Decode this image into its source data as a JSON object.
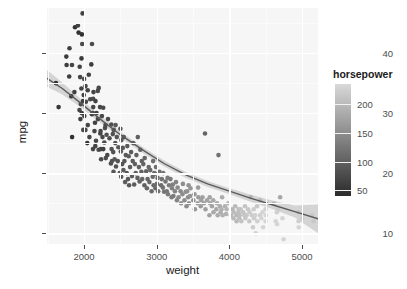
{
  "chart_data": {
    "type": "scatter",
    "title": "",
    "xlabel": "weight",
    "ylabel": "mpg",
    "xlim": [
      1490,
      5220
    ],
    "ylim": [
      8.2,
      47.5
    ],
    "xticks": [
      2000,
      3000,
      4000,
      5000
    ],
    "yticks": [
      10,
      20,
      30,
      40
    ],
    "xtick_labels": [
      "2000",
      "3000",
      "4000",
      "5000"
    ],
    "ytick_labels": [
      "10",
      "20",
      "30",
      "40"
    ],
    "grid": true,
    "legend": {
      "title": "horsepower",
      "position": "right",
      "type": "continuous-colorbar",
      "range": [
        40,
        235
      ],
      "ticks": [
        50,
        100,
        150,
        200
      ],
      "tick_labels": [
        "50",
        "100",
        "150",
        "200"
      ],
      "low_color": "#2b2b2b",
      "high_color": "#d9d9d9"
    },
    "smooth": {
      "type": "loess-trend-line",
      "line_color": "#5a5a5a",
      "ribbon_color": "#c8c8c8",
      "points_x": [
        1490,
        1700,
        1950,
        2200,
        2500,
        2800,
        3100,
        3400,
        3700,
        4000,
        4300,
        4600,
        4900,
        5220
      ],
      "points_y": [
        35.8,
        34.1,
        31.7,
        29.2,
        26.4,
        23.9,
        21.6,
        19.7,
        18.2,
        17.0,
        15.8,
        14.7,
        13.6,
        12.4
      ],
      "ribbon_upper": [
        37.2,
        35.1,
        32.4,
        29.8,
        26.9,
        24.4,
        22.1,
        20.2,
        18.7,
        17.5,
        16.4,
        15.4,
        14.6,
        14.8
      ],
      "ribbon_lower": [
        34.4,
        33.1,
        31.0,
        28.6,
        25.9,
        23.4,
        21.1,
        19.2,
        17.7,
        16.5,
        15.2,
        14.0,
        12.6,
        10.0
      ]
    },
    "point_color_scale": "grayscale-by-horsepower",
    "points": [
      [
        1613,
        35.0,
        46
      ],
      [
        1649,
        31.0,
        52
      ],
      [
        1755,
        39.4,
        58
      ],
      [
        1760,
        38.0,
        60
      ],
      [
        1795,
        36.1,
        60
      ],
      [
        1800,
        40.8,
        62
      ],
      [
        1825,
        32.8,
        52
      ],
      [
        1835,
        26.0,
        46
      ],
      [
        1834,
        38.0,
        67
      ],
      [
        1867,
        33.5,
        65
      ],
      [
        1875,
        44.3,
        48
      ],
      [
        1915,
        44.6,
        67
      ],
      [
        1925,
        43.4,
        48
      ],
      [
        1937,
        30.5,
        70
      ],
      [
        1940,
        37.7,
        67
      ],
      [
        1945,
        36.0,
        70
      ],
      [
        1950,
        29.0,
        63
      ],
      [
        1955,
        31.5,
        71
      ],
      [
        1963,
        34.1,
        68
      ],
      [
        1965,
        39.1,
        58
      ],
      [
        1968,
        30.0,
        63
      ],
      [
        1970,
        43.1,
        48
      ],
      [
        1975,
        41.5,
        76
      ],
      [
        1980,
        46.6,
        65
      ],
      [
        1985,
        32.0,
        65
      ],
      [
        1990,
        27.2,
        71
      ],
      [
        1995,
        33.0,
        67
      ],
      [
        2000,
        35.7,
        80
      ],
      [
        2003,
        29.5,
        68
      ],
      [
        2019,
        27.2,
        71
      ],
      [
        2020,
        34.5,
        70
      ],
      [
        2025,
        31.9,
        71
      ],
      [
        2045,
        25.0,
        52
      ],
      [
        2050,
        33.8,
        67
      ],
      [
        2051,
        28.0,
        71
      ],
      [
        2065,
        36.4,
        67
      ],
      [
        2074,
        26.0,
        70
      ],
      [
        2085,
        32.3,
        75
      ],
      [
        2100,
        38.1,
        60
      ],
      [
        2108,
        29.8,
        65
      ],
      [
        2110,
        41.5,
        76
      ],
      [
        2120,
        30.0,
        70
      ],
      [
        2123,
        24.0,
        73
      ],
      [
        2124,
        32.4,
        75
      ],
      [
        2126,
        31.0,
        70
      ],
      [
        2130,
        33.5,
        67
      ],
      [
        2144,
        27.0,
        70
      ],
      [
        2150,
        28.4,
        65
      ],
      [
        2155,
        24.5,
        68
      ],
      [
        2158,
        32.0,
        67
      ],
      [
        2164,
        25.4,
        75
      ],
      [
        2171,
        30.0,
        68
      ],
      [
        2189,
        33.7,
        75
      ],
      [
        2190,
        29.0,
        70
      ],
      [
        2200,
        23.9,
        77
      ],
      [
        2202,
        34.2,
        72
      ],
      [
        2219,
        31.0,
        70
      ],
      [
        2223,
        26.6,
        68
      ],
      [
        2228,
        27.0,
        71
      ],
      [
        2230,
        24.0,
        70
      ],
      [
        2234,
        22.3,
        76
      ],
      [
        2245,
        29.5,
        75
      ],
      [
        2254,
        26.0,
        72
      ],
      [
        2264,
        30.9,
        72
      ],
      [
        2265,
        24.0,
        65
      ],
      [
        2278,
        25.1,
        75
      ],
      [
        2288,
        27.5,
        78
      ],
      [
        2295,
        28.0,
        75
      ],
      [
        2300,
        22.5,
        80
      ],
      [
        2310,
        26.4,
        83
      ],
      [
        2320,
        23.0,
        75
      ],
      [
        2330,
        29.0,
        76
      ],
      [
        2350,
        25.8,
        80
      ],
      [
        2370,
        21.6,
        78
      ],
      [
        2375,
        28.1,
        79
      ],
      [
        2379,
        24.0,
        85
      ],
      [
        2385,
        22.0,
        85
      ],
      [
        2395,
        26.5,
        84
      ],
      [
        2401,
        23.5,
        83
      ],
      [
        2405,
        20.2,
        88
      ],
      [
        2408,
        27.2,
        84
      ],
      [
        2420,
        22.3,
        88
      ],
      [
        2430,
        25.0,
        85
      ],
      [
        2434,
        28.0,
        90
      ],
      [
        2440,
        21.1,
        85
      ],
      [
        2451,
        26.0,
        88
      ],
      [
        2464,
        22.0,
        86
      ],
      [
        2472,
        24.3,
        90
      ],
      [
        2490,
        20.0,
        88
      ],
      [
        2500,
        27.4,
        88
      ],
      [
        2506,
        23.6,
        90
      ],
      [
        2511,
        19.4,
        92
      ],
      [
        2514,
        25.5,
        92
      ],
      [
        2525,
        21.5,
        88
      ],
      [
        2533,
        24.2,
        90
      ],
      [
        2542,
        20.5,
        95
      ],
      [
        2545,
        26.0,
        90
      ],
      [
        2556,
        22.0,
        90
      ],
      [
        2565,
        18.5,
        95
      ],
      [
        2575,
        23.0,
        92
      ],
      [
        2587,
        20.0,
        90
      ],
      [
        2595,
        24.5,
        92
      ],
      [
        2605,
        19.0,
        90
      ],
      [
        2615,
        22.8,
        95
      ],
      [
        2620,
        18.0,
        92
      ],
      [
        2634,
        21.0,
        95
      ],
      [
        2648,
        23.5,
        95
      ],
      [
        2660,
        19.5,
        97
      ],
      [
        2670,
        22.0,
        95
      ],
      [
        2678,
        25.0,
        100
      ],
      [
        2690,
        18.1,
        95
      ],
      [
        2700,
        21.5,
        97
      ],
      [
        2711,
        20.0,
        97
      ],
      [
        2720,
        23.0,
        100
      ],
      [
        2735,
        19.2,
        100
      ],
      [
        2740,
        26.0,
        100
      ],
      [
        2755,
        21.0,
        98
      ],
      [
        2765,
        18.6,
        100
      ],
      [
        2774,
        23.9,
        105
      ],
      [
        2789,
        20.2,
        100
      ],
      [
        2795,
        22.0,
        103
      ],
      [
        2800,
        19.0,
        105
      ],
      [
        2815,
        21.5,
        105
      ],
      [
        2830,
        18.0,
        100
      ],
      [
        2835,
        22.5,
        105
      ],
      [
        2855,
        20.3,
        103
      ],
      [
        2865,
        17.5,
        110
      ],
      [
        2875,
        19.0,
        105
      ],
      [
        2890,
        21.0,
        110
      ],
      [
        2900,
        18.5,
        108
      ],
      [
        2910,
        20.5,
        110
      ],
      [
        2930,
        17.0,
        110
      ],
      [
        2945,
        19.4,
        112
      ],
      [
        2950,
        22.0,
        115
      ],
      [
        2957,
        18.0,
        110
      ],
      [
        2965,
        20.0,
        110
      ],
      [
        2979,
        19.9,
        115
      ],
      [
        2984,
        17.5,
        110
      ],
      [
        2990,
        21.0,
        115
      ],
      [
        3003,
        18.2,
        115
      ],
      [
        3012,
        19.2,
        115
      ],
      [
        3021,
        17.0,
        120
      ],
      [
        3039,
        20.2,
        120
      ],
      [
        3060,
        18.0,
        115
      ],
      [
        3070,
        19.0,
        120
      ],
      [
        3085,
        17.6,
        120
      ],
      [
        3090,
        20.0,
        125
      ],
      [
        3102,
        16.9,
        122
      ],
      [
        3121,
        18.6,
        125
      ],
      [
        3139,
        17.0,
        125
      ],
      [
        3150,
        19.2,
        130
      ],
      [
        3155,
        16.5,
        130
      ],
      [
        3169,
        18.0,
        130
      ],
      [
        3190,
        19.0,
        130
      ],
      [
        3205,
        16.0,
        130
      ],
      [
        3211,
        17.5,
        135
      ],
      [
        3221,
        18.1,
        135
      ],
      [
        3230,
        16.2,
        130
      ],
      [
        3250,
        17.0,
        140
      ],
      [
        3265,
        18.5,
        140
      ],
      [
        3278,
        15.5,
        140
      ],
      [
        3288,
        17.6,
        145
      ],
      [
        3302,
        16.0,
        145
      ],
      [
        3329,
        17.0,
        145
      ],
      [
        3336,
        15.0,
        150
      ],
      [
        3353,
        16.5,
        150
      ],
      [
        3360,
        18.2,
        150
      ],
      [
        3381,
        15.5,
        150
      ],
      [
        3399,
        16.9,
        150
      ],
      [
        3410,
        14.5,
        150
      ],
      [
        3420,
        17.0,
        155
      ],
      [
        3432,
        16.0,
        150
      ],
      [
        3439,
        18.0,
        155
      ],
      [
        3445,
        15.0,
        155
      ],
      [
        3459,
        16.2,
        155
      ],
      [
        3465,
        17.5,
        160
      ],
      [
        3504,
        15.5,
        150
      ],
      [
        3520,
        16.5,
        160
      ],
      [
        3525,
        14.0,
        160
      ],
      [
        3563,
        15.0,
        165
      ],
      [
        3570,
        17.6,
        165
      ],
      [
        3574,
        16.0,
        165
      ],
      [
        3605,
        14.5,
        165
      ],
      [
        3613,
        15.5,
        170
      ],
      [
        3630,
        16.0,
        170
      ],
      [
        3651,
        15.0,
        170
      ],
      [
        3664,
        26.6,
        105
      ],
      [
        3672,
        14.0,
        170
      ],
      [
        3693,
        15.5,
        175
      ],
      [
        3725,
        13.0,
        175
      ],
      [
        3730,
        16.0,
        175
      ],
      [
        3735,
        15.0,
        175
      ],
      [
        3761,
        14.5,
        175
      ],
      [
        3777,
        15.5,
        180
      ],
      [
        3781,
        13.5,
        180
      ],
      [
        3820,
        14.0,
        180
      ],
      [
        3830,
        15.0,
        180
      ],
      [
        3840,
        13.0,
        185
      ],
      [
        3850,
        23.0,
        120
      ],
      [
        3870,
        14.5,
        185
      ],
      [
        3880,
        13.5,
        185
      ],
      [
        3892,
        14.0,
        190
      ],
      [
        3900,
        16.0,
        185
      ],
      [
        3907,
        13.0,
        190
      ],
      [
        3940,
        14.5,
        190
      ],
      [
        3955,
        13.2,
        190
      ],
      [
        3962,
        14.0,
        195
      ],
      [
        3988,
        15.0,
        190
      ],
      [
        4020,
        13.0,
        195
      ],
      [
        4042,
        14.0,
        195
      ],
      [
        4055,
        12.5,
        200
      ],
      [
        4060,
        13.5,
        200
      ],
      [
        4080,
        14.5,
        200
      ],
      [
        4096,
        13.0,
        200
      ],
      [
        4100,
        12.0,
        200
      ],
      [
        4124,
        13.5,
        205
      ],
      [
        4129,
        14.0,
        205
      ],
      [
        4135,
        12.5,
        205
      ],
      [
        4141,
        13.0,
        205
      ],
      [
        4154,
        14.0,
        210
      ],
      [
        4165,
        12.0,
        210
      ],
      [
        4190,
        13.5,
        210
      ],
      [
        4209,
        13.0,
        210
      ],
      [
        4215,
        14.5,
        212
      ],
      [
        4220,
        12.5,
        215
      ],
      [
        4237,
        13.0,
        215
      ],
      [
        4257,
        14.0,
        215
      ],
      [
        4274,
        12.0,
        215
      ],
      [
        4278,
        13.5,
        218
      ],
      [
        4294,
        16.0,
        190
      ],
      [
        4312,
        13.0,
        220
      ],
      [
        4325,
        11.0,
        220
      ],
      [
        4335,
        14.0,
        220
      ],
      [
        4341,
        12.5,
        220
      ],
      [
        4354,
        13.0,
        225
      ],
      [
        4363,
        10.0,
        225
      ],
      [
        4380,
        14.5,
        215
      ],
      [
        4385,
        12.0,
        225
      ],
      [
        4422,
        13.0,
        225
      ],
      [
        4425,
        15.5,
        200
      ],
      [
        4440,
        12.5,
        228
      ],
      [
        4456,
        13.5,
        228
      ],
      [
        4464,
        11.0,
        230
      ],
      [
        4498,
        12.0,
        230
      ],
      [
        4499,
        14.0,
        225
      ],
      [
        4502,
        13.0,
        230
      ],
      [
        4615,
        15.0,
        200
      ],
      [
        4638,
        12.0,
        230
      ],
      [
        4654,
        13.5,
        225
      ],
      [
        4657,
        11.5,
        230
      ],
      [
        4668,
        14.0,
        220
      ],
      [
        4699,
        16.0,
        180
      ],
      [
        4732,
        12.5,
        230
      ],
      [
        4746,
        9.0,
        230
      ],
      [
        4951,
        12.0,
        225
      ],
      [
        4952,
        13.5,
        210
      ],
      [
        4955,
        11.0,
        230
      ],
      [
        4997,
        12.5,
        220
      ],
      [
        5140,
        13.0,
        215
      ],
      [
        5160,
        12.0,
        215
      ]
    ]
  }
}
